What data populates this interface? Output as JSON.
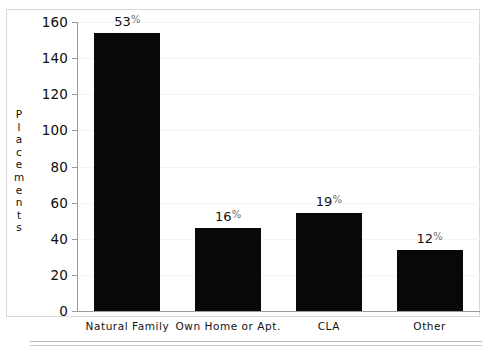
{
  "chart_data": {
    "type": "bar",
    "title": "",
    "xlabel": "",
    "ylabel": "Placements",
    "ylim": [
      0,
      160
    ],
    "ytick_step": 20,
    "yticks": [
      0,
      20,
      40,
      60,
      80,
      100,
      120,
      140,
      160
    ],
    "grid": true,
    "legend": "none",
    "categories": [
      "Natural Family",
      "Own Home or Apt.",
      "CLA",
      "Other"
    ],
    "values": [
      154,
      46,
      54,
      34
    ],
    "data_labels": [
      "53%",
      "16%",
      "19%",
      "12%"
    ],
    "percentages": [
      53,
      16,
      19,
      12
    ],
    "bar_color": "#080808",
    "series": [
      {
        "name": "Placements",
        "values": [
          154,
          46,
          54,
          34
        ]
      }
    ]
  },
  "axis": {
    "y_title_letters": [
      "P",
      "l",
      "a",
      "c",
      "e",
      "m",
      "e",
      "n",
      "t",
      "s"
    ]
  },
  "colors": {
    "bar": "#080808",
    "frame": "#d8d8d8",
    "gridline": "#f4f4f4",
    "axis": "#9a9a9a",
    "rule": "#b9b9b9",
    "text": "#111111"
  }
}
